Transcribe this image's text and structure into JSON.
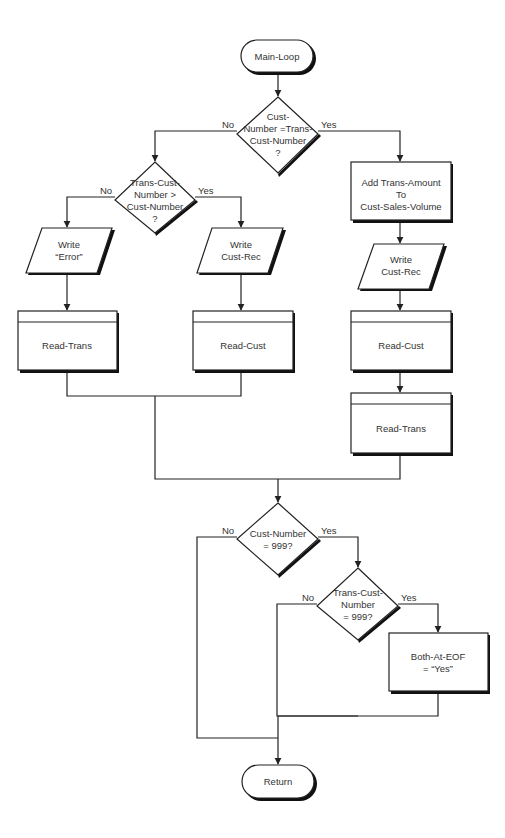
{
  "diagram": {
    "type": "flowchart",
    "title": "Main-Loop",
    "nodes": {
      "start": {
        "shape": "terminal",
        "label": "Main-Loop"
      },
      "d1": {
        "shape": "decision",
        "lines": [
          "Cust-",
          "Number =Trans-",
          "Cust-Number",
          "?"
        ],
        "no_label": "No",
        "yes_label": "Yes"
      },
      "d2": {
        "shape": "decision",
        "lines": [
          "Trans-Cust-",
          "Number >",
          "Cust-Number",
          "?"
        ],
        "no_label": "No",
        "yes_label": "Yes"
      },
      "write_error": {
        "shape": "io",
        "lines": [
          "Write",
          "“Error”"
        ]
      },
      "write_cust_rec_left": {
        "shape": "io",
        "lines": [
          "Write",
          "Cust-Rec"
        ]
      },
      "read_trans_left": {
        "shape": "predefined-process",
        "label": "Read-Trans"
      },
      "read_cust_left": {
        "shape": "predefined-process",
        "label": "Read-Cust"
      },
      "add_box": {
        "shape": "process",
        "lines": [
          "Add Trans-Amount",
          "To",
          "Cust-Sales-Volume"
        ]
      },
      "write_cust_rec_right": {
        "shape": "io",
        "lines": [
          "Write",
          "Cust-Rec"
        ]
      },
      "read_cust_right": {
        "shape": "predefined-process",
        "label": "Read-Cust"
      },
      "read_trans_right": {
        "shape": "predefined-process",
        "label": "Read-Trans"
      },
      "d3": {
        "shape": "decision",
        "lines": [
          "Cust-Number",
          "= 999?"
        ],
        "no_label": "No",
        "yes_label": "Yes"
      },
      "d4": {
        "shape": "decision",
        "lines": [
          "Trans-Cust-",
          "Number",
          "= 999?"
        ],
        "no_label": "No",
        "yes_label": "Yes"
      },
      "set_eof": {
        "shape": "process",
        "lines": [
          "Both-At-EOF",
          "= “Yes”"
        ]
      },
      "end": {
        "shape": "terminal",
        "label": "Return"
      }
    }
  }
}
